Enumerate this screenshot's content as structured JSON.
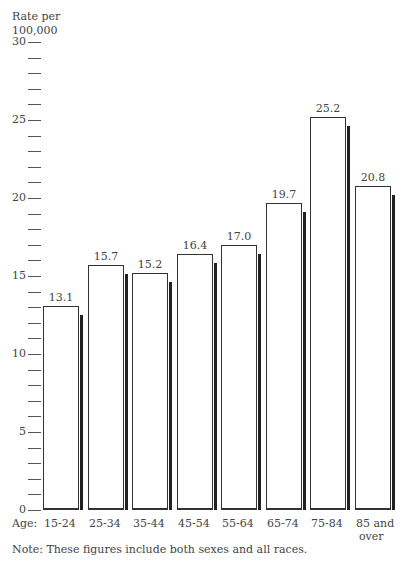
{
  "chart_data": {
    "type": "bar",
    "title": "",
    "ylabel": "Rate per 100,000",
    "xlabel": "Age:",
    "categories": [
      "15-24",
      "25-34",
      "35-44",
      "45-54",
      "55-64",
      "65-74",
      "75-84",
      "85 and over"
    ],
    "values": [
      13.1,
      15.7,
      15.2,
      16.4,
      17.0,
      19.7,
      25.2,
      20.8
    ],
    "value_labels": [
      "13.1",
      "15.7",
      "15.2",
      "16.4",
      "17.0",
      "19.7",
      "25.2",
      "20.8"
    ],
    "ylim": [
      0,
      30
    ],
    "yticks_major": [
      0,
      5,
      10,
      15,
      20,
      25,
      30
    ],
    "ytick_minor_step": 1,
    "grid": false,
    "legend": null,
    "note": "Note:  These figures include both sexes and all races."
  },
  "labels": {
    "ylabel_line1": "Rate per",
    "ylabel_line2": "100,000",
    "age_prefix": "Age:",
    "note": "Note:  These figures include both sexes and all races."
  }
}
